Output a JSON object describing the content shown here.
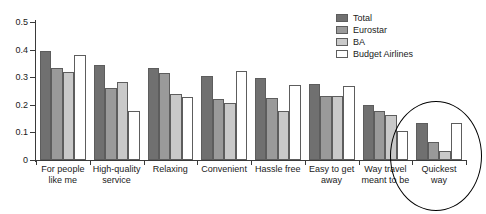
{
  "chart_data": {
    "type": "bar",
    "title": "",
    "xlabel": "",
    "ylabel": "",
    "ylim": [
      0,
      0.5
    ],
    "grid": false,
    "legend_position": "top-right",
    "yticks": [
      "0",
      "0.1",
      "0.2",
      "0.3",
      "0.4",
      "0.5"
    ],
    "ytick_values": [
      0,
      0.1,
      0.2,
      0.3,
      0.4,
      0.5
    ],
    "categories": [
      "For people\nlike me",
      "High-quality\nservice",
      "Relaxing",
      "Convenient",
      "Hassle free",
      "Easy to get\naway",
      "Way travel\nmeant to be",
      "Quickest\nway"
    ],
    "series": [
      {
        "name": "Total",
        "color": "#707070",
        "values": [
          0.395,
          0.343,
          0.335,
          0.306,
          0.297,
          0.277,
          0.198,
          0.133
        ]
      },
      {
        "name": "Eurostar",
        "color": "#9a9a9a",
        "values": [
          0.335,
          0.261,
          0.316,
          0.222,
          0.224,
          0.231,
          0.178,
          0.067
        ]
      },
      {
        "name": "BA",
        "color": "#c9c9c9",
        "values": [
          0.318,
          0.281,
          0.238,
          0.205,
          0.178,
          0.231,
          0.163,
          0.032
        ]
      },
      {
        "name": "Budget Airlines",
        "color": "#ffffff",
        "values": [
          0.382,
          0.178,
          0.228,
          0.323,
          0.272,
          0.267,
          0.105,
          0.133
        ]
      }
    ],
    "annotations": [
      {
        "type": "ellipse",
        "target_category": "Quickest way",
        "color": "#000000"
      }
    ]
  }
}
